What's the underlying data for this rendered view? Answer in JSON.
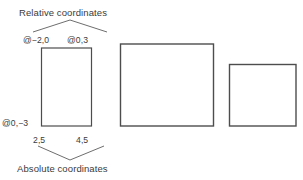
{
  "figure": {
    "background_color": "#ffffff",
    "stroke_color": "#4d4d4d",
    "text_color": "#3a3a3a",
    "annotations": {
      "relative_title": "Relative coordinates",
      "absolute_title": "Absolute coordinates",
      "relative_top_left": "@−2,0",
      "relative_top_right": "@0,3",
      "relative_bottom_left": "@0,−3",
      "absolute_bottom_left": "2,5",
      "absolute_bottom_right": "4,5"
    },
    "shapes": [
      {
        "name": "annotated-rectangle",
        "x": 41.5,
        "y": 48.0,
        "width": 50.0,
        "height": 78.0
      },
      {
        "name": "large-rectangle",
        "x": 120.5,
        "y": 44.0,
        "width": 93.0,
        "height": 82.0
      },
      {
        "name": "small-rectangle",
        "x": 229.5,
        "y": 64.5,
        "width": 66.5,
        "height": 61.5
      }
    ],
    "carets": [
      {
        "name": "relative-caret",
        "direction": "up",
        "points": "33,32 70,20 107,32"
      },
      {
        "name": "absolute-caret",
        "direction": "down",
        "points": "38,146 70,160 104,146"
      }
    ]
  }
}
